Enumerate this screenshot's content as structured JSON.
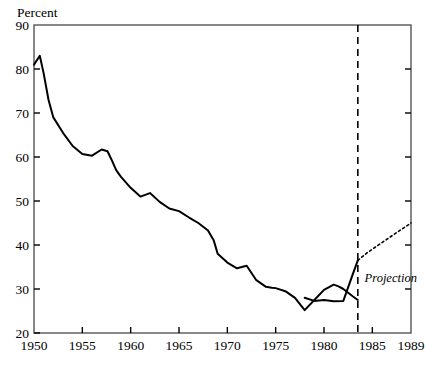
{
  "figure": {
    "background_color": "#ffffff",
    "ink_color": "#000000",
    "frame_color": "#555555"
  },
  "chart_data": {
    "type": "line",
    "title": "",
    "subtitle": "",
    "xlabel": "",
    "ylabel": "Percent",
    "ylabel_position": "top-left",
    "xlim": [
      1950,
      1989
    ],
    "ylim": [
      20,
      90
    ],
    "grid": false,
    "legend": false,
    "legend_position": "none",
    "y_ticks": [
      20,
      30,
      40,
      50,
      60,
      70,
      80,
      90
    ],
    "y_tick_labels": [
      "20",
      "30",
      "40",
      "50",
      "60",
      "70",
      "80",
      "90"
    ],
    "x_ticks": [
      1950,
      1955,
      1960,
      1965,
      1970,
      1975,
      1980,
      1985,
      1989
    ],
    "x_tick_labels": [
      "1950",
      "1955",
      "1960",
      "1965",
      "1970",
      "1975",
      "1980",
      "1985",
      "1989"
    ],
    "series": [
      {
        "name": "Historical",
        "style": "solid",
        "line_width": 2.0,
        "x": [
          1950,
          1950.6,
          1951,
          1951.5,
          1952,
          1953,
          1954,
          1955,
          1956,
          1957,
          1957.6,
          1958,
          1958.5,
          1959,
          1960,
          1961,
          1962,
          1963,
          1964,
          1965,
          1966,
          1967,
          1968,
          1968.6,
          1969,
          1970,
          1971,
          1972,
          1973,
          1974,
          1974.6,
          1975,
          1976,
          1977,
          1978,
          1979,
          1980,
          1981,
          1981.5,
          1982,
          1983,
          1983.5
        ],
        "y": [
          81.0,
          83.0,
          79.0,
          73.0,
          69.0,
          65.5,
          62.5,
          60.7,
          60.3,
          61.7,
          61.3,
          59.5,
          57.0,
          55.5,
          53.0,
          51.0,
          51.8,
          49.8,
          48.3,
          47.7,
          46.3,
          45.0,
          43.3,
          41.0,
          38.0,
          36.0,
          34.7,
          35.3,
          32.0,
          30.5,
          30.3,
          30.2,
          29.5,
          28.0,
          25.2,
          27.5,
          29.8,
          31.0,
          30.6,
          30.0,
          28.3,
          27.5
        ]
      },
      {
        "name": "Historical segment 2",
        "style": "solid",
        "line_width": 2.0,
        "x": [
          1978,
          1979,
          1980,
          1981,
          1982,
          1983,
          1983.5
        ],
        "y": [
          28.0,
          27.3,
          27.5,
          27.2,
          27.3,
          33.5,
          36.5
        ]
      },
      {
        "name": "Projection",
        "style": "dotted",
        "line_width": 1.6,
        "x": [
          1983.5,
          1984.5,
          1985.5,
          1986.5,
          1987.5,
          1989
        ],
        "y": [
          36.5,
          38.3,
          39.8,
          41.3,
          42.8,
          45.0
        ]
      }
    ],
    "annotations": [
      {
        "text": "Projection",
        "x": 1984.2,
        "y": 31.5,
        "style": "italic"
      }
    ],
    "vertical_rules": [
      {
        "x": 1983.5,
        "style": "dashed",
        "label": "projection-divider"
      }
    ]
  }
}
